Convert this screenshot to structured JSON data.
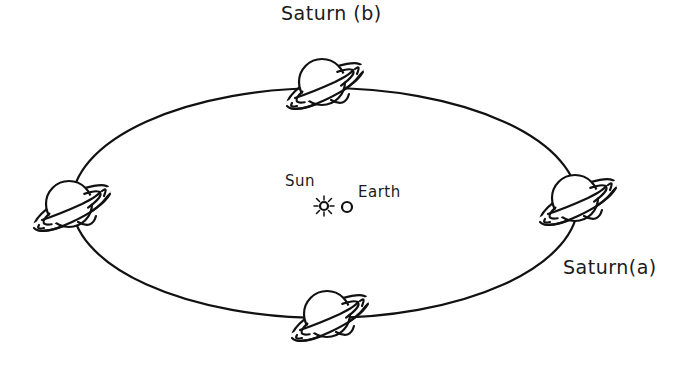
{
  "diagram": {
    "labels": {
      "saturn_b": "Saturn (b)",
      "saturn_a": "Saturn(a)",
      "sun": "Sun",
      "earth": "Earth"
    },
    "orbit": {
      "cx": 325,
      "cy": 203,
      "rx": 253,
      "ry": 115
    },
    "planets": [
      {
        "id": "saturn-top",
        "x": 325,
        "y": 86
      },
      {
        "id": "saturn-right",
        "x": 578,
        "y": 202
      },
      {
        "id": "saturn-bottom",
        "x": 330,
        "y": 318
      },
      {
        "id": "saturn-left",
        "x": 72,
        "y": 208
      }
    ],
    "sun": {
      "x": 324,
      "y": 206,
      "icon": "sun-icon"
    },
    "earth": {
      "x": 347,
      "y": 207,
      "icon": "earth-circle-icon"
    },
    "colors": {
      "ink": "#111111",
      "background": "#ffffff"
    }
  }
}
